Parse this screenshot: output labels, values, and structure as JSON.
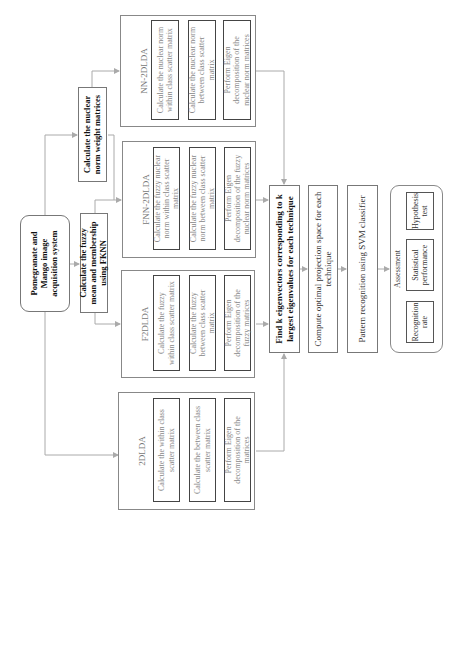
{
  "diagram": {
    "source": {
      "label": "Pomegranate and Mango image acquisition system"
    },
    "fknn": {
      "label": "Calculate the fuzzy mean and membership using FKNN"
    },
    "nuclear_weight": {
      "label": "Calculate the nuclear norm weight matrices"
    },
    "techniques": [
      {
        "title": "2DLDA",
        "steps": [
          "Calculate the within class scatter matrix",
          "Calculate the between class scatter matrix",
          "Perform Eigen decomposition of the matrices"
        ]
      },
      {
        "title": "F2DLDA",
        "steps": [
          "Calculate the fuzzy within class scatter matrix",
          "Calculate the fuzzy between class scatter matrix",
          "Perform Eigen decomposition of the fuzzy matrices"
        ]
      },
      {
        "title": "FNN-2DLDA",
        "steps": [
          "Calculate the fuzzy nuclear norm within class scatter matrix",
          "Calculate the fuzzy nuclear norm between class scatter matrix",
          "Perform Eigen decomposition of the fuzzy nuclear norm matrices"
        ]
      },
      {
        "title": "NN-2DLDA",
        "steps": [
          "Calculate the nuclear norm within class scatter matrix",
          "Calculate the nuclear norm between class scatter matrix",
          "Perform Eigen decomposition of the nuclear norm matrices"
        ]
      }
    ],
    "pipeline": [
      "Find k eigenvectors corresponding to k largest eigenvalues for each technique",
      "Compute optimal projection space for each technique",
      "Pattern recognition using SVM classifier"
    ],
    "assessment": {
      "title": "Assessment",
      "items": [
        "Recognition rate",
        "Statistical performance",
        "Hypothesis test"
      ]
    },
    "colors": {
      "line": "#aaaaaa",
      "box_border": "#444444",
      "muted_text": "#888888"
    }
  }
}
